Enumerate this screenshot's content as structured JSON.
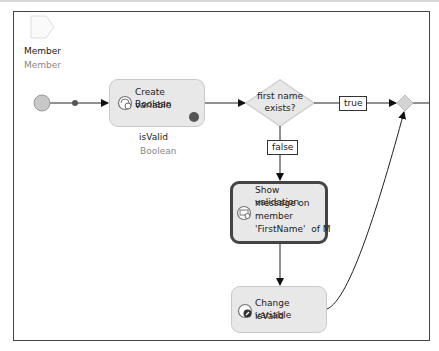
{
  "parameter": {
    "name": "Member",
    "type": "Member",
    "icon": "parameter-icon"
  },
  "start_event": {
    "icon": "start-event-icon"
  },
  "nodes": {
    "create_variable": {
      "label": "Create Boolean variable",
      "line1": "Create Boolean",
      "line2": "variable",
      "var_name": "isValid",
      "var_type": "Boolean",
      "icon": "create-variable-icon"
    },
    "decision": {
      "line1": "first name",
      "line2": "exists?"
    },
    "show_validation": {
      "line1": "Show validation",
      "line2": "message on",
      "line3": "member",
      "line4": "'FirstName'  of M",
      "icon": "validation-message-icon"
    },
    "change_variable": {
      "line1": "Change variable",
      "line2": "isValid",
      "icon": "change-variable-icon"
    }
  },
  "edges": {
    "true_label": "true",
    "false_label": "false"
  },
  "colors": {
    "node_fill": "#e8e8e8",
    "node_border": "#c9c9c9",
    "selected_border": "#444444",
    "start_fill": "#c8c8c8",
    "line": "#222222"
  }
}
